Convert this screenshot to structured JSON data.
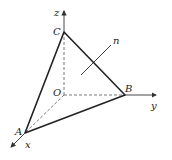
{
  "diagram": {
    "type": "3d-coordinate-tetrahedron",
    "points": {
      "O": {
        "label": "O",
        "x": 64,
        "y": 95
      },
      "A": {
        "label": "A",
        "x": 25,
        "y": 133
      },
      "B": {
        "label": "B",
        "x": 125,
        "y": 95
      },
      "C": {
        "label": "C",
        "x": 64,
        "y": 32
      }
    },
    "axes": {
      "x": {
        "label": "x"
      },
      "y": {
        "label": "y"
      },
      "z": {
        "label": "z"
      }
    },
    "normal_vector": {
      "label": "n"
    },
    "colors": {
      "solid_edge": "#222222",
      "axis": "#333333",
      "dashed": "#555555",
      "normal": "#444444"
    }
  }
}
